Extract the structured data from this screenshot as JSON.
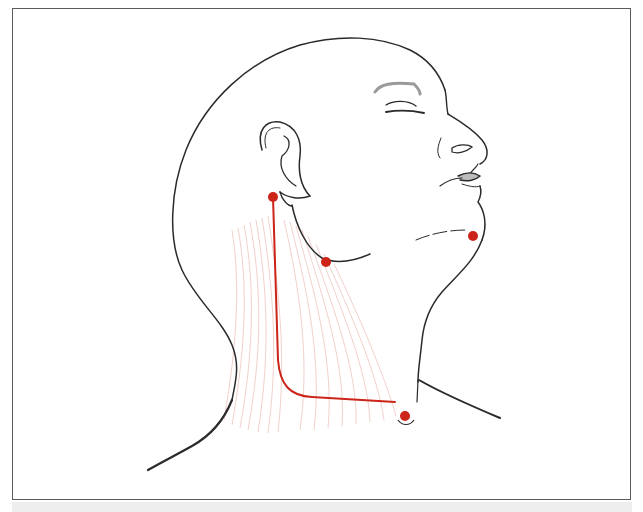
{
  "figure": {
    "type": "anatomical-illustration",
    "colors": {
      "outline": "#2a2a2a",
      "brow": "#9a9a9a",
      "landmark": "#cc2418",
      "muscle_fibers": "#e8a8a0",
      "frame_border": "#5a5a5a",
      "background": "#ffffff",
      "bottom_strip": "#eeeeee"
    },
    "landmarks": [
      {
        "id": "below-ear",
        "x": 273,
        "y": 197,
        "r": 5
      },
      {
        "id": "jaw-angle",
        "x": 326,
        "y": 262,
        "r": 5
      },
      {
        "id": "chin",
        "x": 473,
        "y": 236,
        "r": 5
      },
      {
        "id": "sternal-notch",
        "x": 405,
        "y": 416,
        "r": 5
      }
    ],
    "marker_path": {
      "description": "red line from below ear down the neck then across to the sternal notch",
      "points": [
        [
          273,
          197
        ],
        [
          280,
          370
        ],
        [
          300,
          395
        ],
        [
          395,
          402
        ]
      ]
    }
  }
}
